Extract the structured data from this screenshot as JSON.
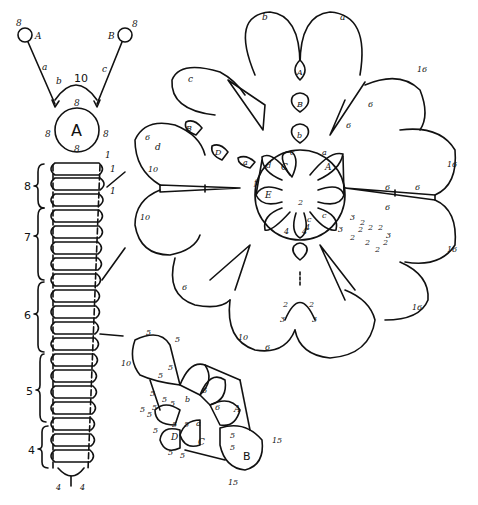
{
  "diagram": {
    "type": "tatting-pattern",
    "parts": {
      "cord": {
        "rings": [
          {
            "label": "A",
            "count": "8"
          },
          {
            "label": "B",
            "count": "8"
          }
        ],
        "chains": [
          {
            "label": "a"
          },
          {
            "label": "b",
            "count": "10"
          },
          {
            "label": "c"
          }
        ],
        "big_ring": {
          "label": "A",
          "counts": [
            "8",
            "8",
            "8",
            "8"
          ]
        },
        "top_counts": [
          "1",
          "1",
          "1"
        ],
        "sections": [
          {
            "label": "8"
          },
          {
            "label": "7"
          },
          {
            "label": "6"
          },
          {
            "label": "5"
          },
          {
            "label": "4"
          }
        ],
        "bottom_counts": [
          "4",
          "4"
        ]
      },
      "rosette": {
        "center_rings": [
          "A",
          "C",
          "E"
        ],
        "center_labels": [
          "a",
          "c",
          "d",
          "f",
          "2",
          "4",
          "4",
          "4",
          "c",
          "c"
        ],
        "petal_labels": [
          "a",
          "b",
          "c",
          "d"
        ],
        "petal_counts": [
          "16",
          "16",
          "16",
          "16",
          "10",
          "10",
          "10",
          "6",
          "6",
          "6",
          "6",
          "6",
          "6",
          "6",
          "6"
        ],
        "chain_rings": [
          "A",
          "B",
          "b",
          "B",
          "D",
          "a"
        ],
        "side_counts": [
          "3",
          "2",
          "3",
          "2",
          "2",
          "2",
          "2",
          "2",
          "2",
          "2",
          "3"
        ],
        "bottom_counts": [
          "2",
          "2",
          "3",
          "3"
        ]
      },
      "motif": {
        "rings": [
          "A",
          "B",
          "C",
          "D",
          "a",
          "b"
        ],
        "counts": [
          "5",
          "5",
          "5",
          "5",
          "10",
          "5",
          "5",
          "6",
          "6",
          "5",
          "5",
          "5",
          "5",
          "5",
          "5",
          "5",
          "5",
          "5",
          "15",
          "15",
          "5",
          "5"
        ]
      }
    }
  }
}
